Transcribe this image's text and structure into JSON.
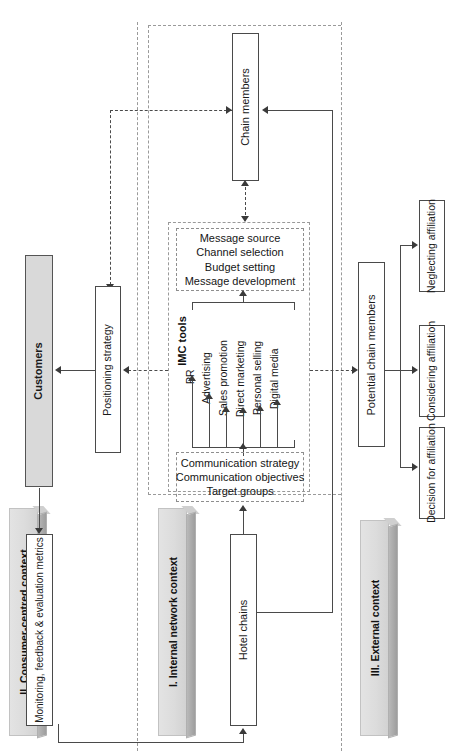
{
  "diagram": {
    "orientation": "rotated-90-ccw"
  },
  "contexts": [
    {
      "id": "consumer",
      "label": "II. Consumer-centred context"
    },
    {
      "id": "internal",
      "label": "I. Internal network context"
    },
    {
      "id": "external",
      "label": "III. External context"
    }
  ],
  "nodes": {
    "chain_members": "Chain members",
    "customers": "Customers",
    "positioning_strategy": "Positioning strategy",
    "potential_chain_members": "Potential chain members",
    "hotel_chains": "Hotel chains",
    "monitoring": "Monitoring, feedback & evaluation metrics",
    "neglecting_affiliation": "Neglecting affiliation",
    "considering_affiliation": "Considering affiliation",
    "decision_for_affiliation": "Decision for affiliation"
  },
  "message_panel": {
    "lines": [
      "Message source",
      "Channel selection",
      "Budget setting",
      "Message development"
    ]
  },
  "strategy_panel": {
    "lines": [
      "Communication strategy",
      "Communication objectives",
      "Target groups"
    ]
  },
  "imc": {
    "label": "IMC tools",
    "tools": [
      "PR",
      "Advertising",
      "Sales promotion",
      "Direct marketing",
      "Personal selling",
      "Digital media"
    ]
  },
  "colors": {
    "box_border": "#4a4a4a",
    "box_fill": "#ffffff",
    "highlight_fill": "#d9d9d9",
    "slab_fill": "#dcdcdc",
    "dashed": "#9a9a9a",
    "text": "#161616"
  }
}
